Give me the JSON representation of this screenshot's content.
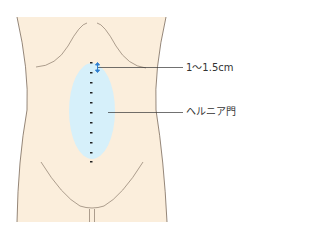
{
  "diagram": {
    "labels": {
      "distance": "1～1.5cm",
      "hernia_gate": "ヘルニア門"
    },
    "colors": {
      "skin": "#FBEEDC",
      "outline": "#7a6a5a",
      "hernia_area": "#D6F0FA",
      "arrow": "#2e7fd0",
      "suture": "#222222",
      "leader_line": "#333333"
    },
    "suture_dots": 11
  }
}
